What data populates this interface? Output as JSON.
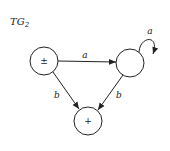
{
  "title": {
    "main": "TG",
    "subscript": "2"
  },
  "nodes": [
    {
      "id": "start",
      "label": "±",
      "cx": 44,
      "cy": 61,
      "r": 14
    },
    {
      "id": "middle",
      "label": "",
      "cx": 130,
      "cy": 63,
      "r": 14
    },
    {
      "id": "final",
      "label": "+",
      "cx": 88,
      "cy": 121,
      "r": 14
    }
  ],
  "edges": [
    {
      "from": "start",
      "to": "middle",
      "label": "a"
    },
    {
      "from": "middle",
      "to": "middle",
      "label": "a",
      "self_loop": true
    },
    {
      "from": "start",
      "to": "final",
      "label": "b"
    },
    {
      "from": "middle",
      "to": "final",
      "label": "b"
    }
  ],
  "colors": {
    "stroke": "#222222",
    "background": "#ffffff"
  }
}
